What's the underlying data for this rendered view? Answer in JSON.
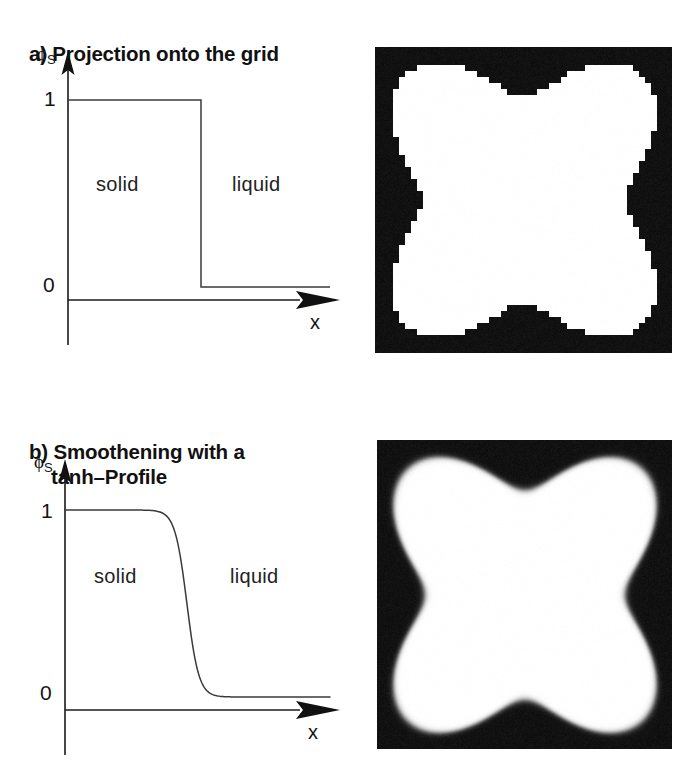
{
  "figure": {
    "panels": [
      {
        "id": "a",
        "heading_line1": "a) Projection onto the grid",
        "heading_line2": "",
        "plot": {
          "y_axis_symbol": "ϕ",
          "y_axis_subscript": "S",
          "x_axis_label": "x",
          "y_ticks": [
            "1",
            "0"
          ],
          "region_left": "solid",
          "region_right": "liquid"
        },
        "image_caption": "pixelated four-lobed solid region on grid"
      },
      {
        "id": "b",
        "heading_line1": "b) Smoothening with a",
        "heading_line2": "tanh–Profile",
        "plot": {
          "y_axis_symbol": "ϕ",
          "y_axis_subscript": "S",
          "x_axis_label": "x",
          "y_ticks": [
            "1",
            "0"
          ],
          "region_left": "solid",
          "region_right": "liquid"
        },
        "image_caption": "smoothed four-lobed solid region"
      }
    ]
  },
  "chart_data": [
    {
      "type": "line",
      "id": "panel-a-profile",
      "title": "a) Projection onto the grid",
      "xlabel": "x",
      "ylabel": "phi_S",
      "ylim": [
        0,
        1
      ],
      "ytick_values": [
        0,
        1
      ],
      "ytick_labels": [
        "1",
        "0"
      ],
      "grid": false,
      "legend": "none",
      "annotations": [
        "solid",
        "liquid"
      ],
      "description": "sharp step function: phi_S = 1 for x < x_interface, phi_S = 0 for x > x_interface",
      "x": [
        0,
        0.46,
        0.46,
        1.0
      ],
      "values": [
        1,
        1,
        0,
        0
      ],
      "interface_x": 0.46
    },
    {
      "type": "line",
      "id": "panel-b-profile",
      "title": "b) Smoothening with a tanh-Profile",
      "xlabel": "x",
      "ylabel": "phi_S",
      "ylim": [
        0,
        1
      ],
      "ytick_values": [
        0,
        1
      ],
      "ytick_labels": [
        "1",
        "0"
      ],
      "grid": false,
      "legend": "none",
      "annotations": [
        "solid",
        "liquid"
      ],
      "description": "smooth tanh profile: phi_S = 0.5*(1 - tanh((x - x0)/w))",
      "interface_x": 0.46,
      "width": 0.045,
      "x": [
        0.0,
        0.1,
        0.2,
        0.26,
        0.31,
        0.35,
        0.38,
        0.41,
        0.44,
        0.46,
        0.48,
        0.51,
        0.54,
        0.57,
        0.61,
        0.66,
        0.72,
        0.8,
        0.9,
        1.0
      ],
      "values": [
        1.0,
        1.0,
        0.99,
        0.98,
        0.96,
        0.93,
        0.89,
        0.82,
        0.68,
        0.5,
        0.32,
        0.16,
        0.08,
        0.04,
        0.02,
        0.01,
        0.01,
        0.0,
        0.0,
        0.0
      ]
    }
  ]
}
